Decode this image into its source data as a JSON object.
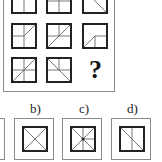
{
  "puzzle": {
    "grid": [
      [
        {
          "name": "r1c1",
          "lines": [
            [
              13,
              0,
              13,
              26
            ],
            [
              13,
              0,
              26,
              13
            ]
          ]
        },
        {
          "name": "r1c2",
          "lines": [
            [
              13,
              0,
              13,
              26
            ],
            [
              0,
              13,
              26,
              13
            ]
          ]
        },
        {
          "name": "r1c3",
          "lines": [
            [
              0,
              0,
              26,
              26
            ]
          ]
        }
      ],
      [
        {
          "name": "r2c1",
          "lines": [
            [
              13,
              0,
              13,
              26
            ],
            [
              0,
              13,
              13,
              13
            ],
            [
              13,
              13,
              26,
              0
            ]
          ]
        },
        {
          "name": "r2c2",
          "lines": [
            [
              13,
              0,
              13,
              13
            ],
            [
              0,
              13,
              26,
              13
            ],
            [
              0,
              26,
              26,
              0
            ]
          ]
        },
        {
          "name": "r2c3",
          "lines": [
            [
              13,
              13,
              26,
              13
            ],
            [
              13,
              13,
              13,
              26
            ],
            [
              0,
              26,
              13,
              13
            ]
          ]
        }
      ],
      [
        {
          "name": "r3c1",
          "lines": [
            [
              13,
              0,
              13,
              26
            ],
            [
              0,
              13,
              26,
              13
            ],
            [
              0,
              26,
              26,
              0
            ]
          ]
        },
        {
          "name": "r3c2",
          "lines": [
            [
              13,
              0,
              13,
              13
            ],
            [
              0,
              13,
              26,
              13
            ],
            [
              0,
              0,
              26,
              26
            ]
          ]
        },
        {
          "name": "r3c3",
          "question": "?"
        }
      ]
    ],
    "options": [
      {
        "label": "a)",
        "lines": []
      },
      {
        "label": "b)",
        "lines": [
          [
            0,
            0,
            26,
            26
          ],
          [
            0,
            26,
            26,
            0
          ]
        ]
      },
      {
        "label": "c)",
        "lines": [
          [
            0,
            0,
            26,
            26
          ],
          [
            0,
            26,
            26,
            0
          ],
          [
            13,
            0,
            13,
            26
          ],
          [
            13,
            13,
            26,
            13
          ]
        ],
        "dot": true
      },
      {
        "label": "d)",
        "lines": [
          [
            13,
            0,
            13,
            26
          ],
          [
            0,
            0,
            26,
            26
          ]
        ]
      }
    ],
    "colors": {
      "stroke": "#222222",
      "thin": "#555555",
      "frame": "#8a8a8a"
    }
  }
}
